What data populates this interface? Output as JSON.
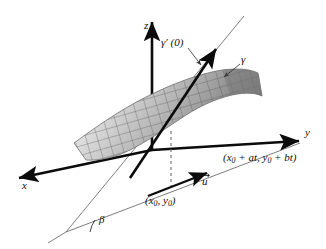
{
  "figure": {
    "background_color": "#ffffff",
    "width": 326,
    "height": 249
  },
  "axes": {
    "z": {
      "label": "z",
      "name": "z-axis",
      "direction": "up"
    },
    "y": {
      "label": "y",
      "name": "y-axis",
      "direction": "right-down"
    },
    "x": {
      "label": "x",
      "name": "x-axis",
      "direction": "left-down"
    }
  },
  "labels": {
    "gamma_prime": {
      "text": "γ′ (0)",
      "meaning": "tangent-vector-gamma-prime-zero"
    },
    "gamma": {
      "text": "γ",
      "meaning": "curve-gamma"
    },
    "beta": {
      "text": "β",
      "meaning": "angle-beta"
    },
    "u_vector": {
      "text": "u",
      "meaning": "direction-vector-u"
    },
    "point_base": {
      "open": "(",
      "x_sym": "x",
      "x_sub": "0",
      "comma": ", ",
      "y_sym": "y",
      "y_sub": "0",
      "close": ")",
      "meaning": "base-point-x0-y0"
    },
    "point_line": {
      "open": "(",
      "x_sym": "x",
      "x_sub": "0",
      "plus_a": " + at, ",
      "y_sym": "y",
      "y_sub": "0",
      "plus_b": " + bt",
      "close": ")",
      "meaning": "parametrized-line-point"
    }
  },
  "colors": {
    "axis": "#0b0b0b",
    "thin_line": "#6e6e6e",
    "surface_light": "#f0f0f0",
    "surface_mid": "#b8b8b8",
    "surface_dark": "#6a6a6a",
    "grid": "#5a5a5a",
    "dashed": "#808080",
    "text": "#111111"
  },
  "elements": {
    "surface": "grey-mesh-saddle-surface",
    "dashed_drop_line": "vertical-dashed-projection-line",
    "tangent_arrow": "thick-black-arrow-gamma-prime",
    "u_arrow": "thick-black-arrow-u"
  }
}
